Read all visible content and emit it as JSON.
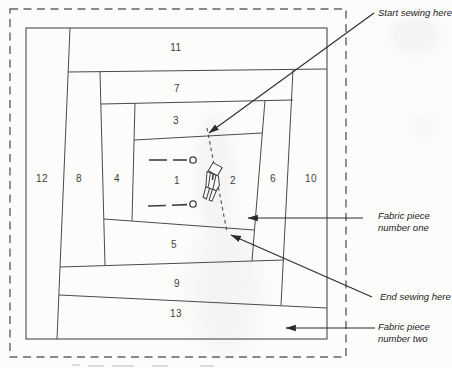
{
  "pieces": [
    {
      "number": "1"
    },
    {
      "number": "2"
    },
    {
      "number": "3"
    },
    {
      "number": "4"
    },
    {
      "number": "5"
    },
    {
      "number": "6"
    },
    {
      "number": "7"
    },
    {
      "number": "8"
    },
    {
      "number": "9"
    },
    {
      "number": "10"
    },
    {
      "number": "11"
    },
    {
      "number": "12"
    },
    {
      "number": "13"
    }
  ],
  "annotations": {
    "start_sewing": "Start sewing here",
    "fabric_piece_one": [
      "Fabric piece",
      "number one"
    ],
    "end_sewing": "End sewing here",
    "fabric_piece_two": [
      "Fabric piece",
      "number two"
    ]
  },
  "icons": {
    "presser_foot": "presser-foot-icon",
    "pin": "pin-icon",
    "arrowhead": "arrowhead-icon"
  },
  "colors": {
    "piece_line": "#4a4a4a",
    "dashed_border": "#636363",
    "stitch_line": "#4d4d4d",
    "arrow": "#2b2b2b",
    "label_text": "#3c3c3c",
    "background": "#fcfcfb"
  }
}
